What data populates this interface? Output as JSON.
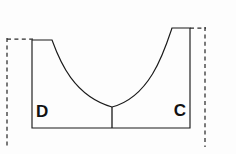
{
  "figure": {
    "kind": "geometry-diagram",
    "background_color": "#fdfdfd",
    "stroke_color": "#1a1a1a",
    "dashed_stroke_color": "#2b2b2b",
    "labels": {
      "left": "D",
      "right": "C"
    },
    "label_positions": {
      "left": {
        "x": 36,
        "y": 113
      },
      "right": {
        "x": 186,
        "y": 112
      }
    },
    "outline": {
      "description": "Closed solid outline: left wall up, short top flat, concave curve down to center, concave curve up to right top flat, right wall down, baseline back to start",
      "points": {
        "left_bottom": {
          "x": 32,
          "y": 128
        },
        "left_top": {
          "x": 32,
          "y": 40
        },
        "left_flat_end": {
          "x": 52,
          "y": 40
        },
        "curve_bottom": {
          "x": 112,
          "y": 107
        },
        "right_flat_start": {
          "x": 172,
          "y": 28
        },
        "right_top": {
          "x": 190,
          "y": 28
        },
        "right_bottom": {
          "x": 190,
          "y": 128
        }
      },
      "path": "M 32 128 L 32 40 L 52 40 C 60 62, 74 96, 112 107 C 150 97, 164 52, 172 28 L 190 28 L 190 128 Z"
    },
    "center_tick": {
      "description": "Short vertical segment from curve low point to baseline",
      "x": 112,
      "y_top": 107,
      "y_bottom": 128
    },
    "dashed_guides": [
      {
        "name": "left-vertical-guide",
        "orientation": "vertical",
        "x": 7,
        "y_start": 38,
        "y_end": 147
      },
      {
        "name": "left-horizontal-guide",
        "orientation": "horizontal",
        "y": 39,
        "x_start": 7,
        "x_end": 33
      },
      {
        "name": "right-vertical-guide",
        "orientation": "vertical",
        "x": 205,
        "y_start": 27,
        "y_end": 147
      },
      {
        "name": "right-horizontal-guide",
        "orientation": "horizontal",
        "y": 28,
        "x_start": 190,
        "x_end": 206
      }
    ]
  }
}
